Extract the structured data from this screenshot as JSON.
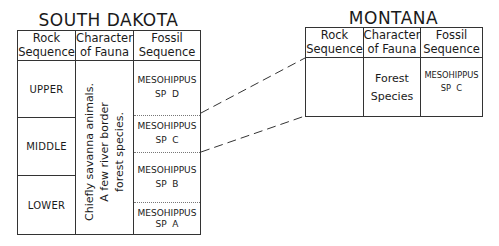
{
  "left_table": {
    "title": "SOUTH DAKOTA",
    "headers": {
      "rock_1": "Rock",
      "rock_2": "Sequence",
      "fauna_1": "Character",
      "fauna_2": "of Fauna",
      "fossil_1": "Fossil",
      "fossil_2": "Sequence"
    },
    "rock_rows": [
      "UPPER",
      "MIDDLE",
      "LOWER"
    ],
    "fauna_lines": [
      "Chiefly savanna animals.",
      "A few river border",
      "forest species."
    ],
    "fossils": [
      {
        "name": "MESOHIPPUS",
        "sp": "SP  D"
      },
      {
        "name": "MESOHIPPUS",
        "sp": "SP  C"
      },
      {
        "name": "MESOHIPPUS",
        "sp": "SP  B"
      },
      {
        "name": "MESOHIPPUS",
        "sp": "SP  A"
      }
    ]
  },
  "right_table": {
    "title": "MONTANA",
    "headers": {
      "rock_1": "Rock",
      "rock_2": "Sequence",
      "fauna_1": "Character",
      "fauna_2": "of Fauna",
      "fossil_1": "Fossil",
      "fossil_2": "Sequence"
    },
    "rock_value": "",
    "fauna_1": "Forest",
    "fauna_2": "Species",
    "fossil": {
      "name": "MESOHIPPUS",
      "sp": "SP  C"
    }
  },
  "correlation": {
    "from": "MESOHIPPUS SP C (South Dakota)",
    "to": "MESOHIPPUS SP C (Montana)",
    "style": "dashed"
  }
}
